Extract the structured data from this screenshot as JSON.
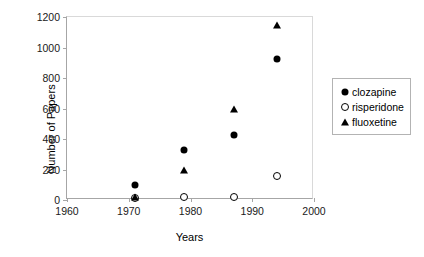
{
  "chart_data": {
    "type": "scatter",
    "title": "",
    "xlabel": "Years",
    "ylabel": "Number of Papers",
    "xlim": [
      1960,
      2000
    ],
    "ylim": [
      0,
      1200
    ],
    "xticks": [
      1960,
      1970,
      1980,
      1990,
      2000
    ],
    "yticks": [
      0,
      200,
      400,
      600,
      800,
      1000,
      1200
    ],
    "xtick_labels": [
      "1960",
      "1970",
      "1980",
      "1990",
      "2000"
    ],
    "ytick_labels": [
      "0",
      "200",
      "400",
      "600",
      "800",
      "1000",
      "1200"
    ],
    "grid": false,
    "legend_position": "right",
    "series": [
      {
        "name": "clozapine",
        "marker": "filled-circle",
        "color": "#000000",
        "x": [
          1971,
          1979,
          1987,
          1994
        ],
        "y": [
          100,
          330,
          425,
          925
        ]
      },
      {
        "name": "risperidone",
        "marker": "open-circle",
        "color": "#000000",
        "x": [
          1971,
          1979,
          1987,
          1994
        ],
        "y": [
          15,
          20,
          20,
          155
        ]
      },
      {
        "name": "fluoxetine",
        "marker": "filled-triangle",
        "color": "#000000",
        "x": [
          1971,
          1979,
          1987,
          1994
        ],
        "y": [
          20,
          200,
          600,
          1150
        ]
      }
    ]
  }
}
